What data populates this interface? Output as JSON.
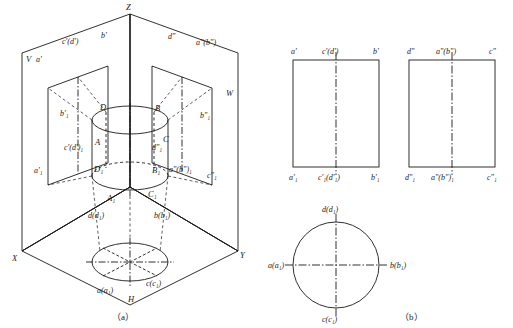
{
  "figure": {
    "caption_a": "（a）",
    "caption_b": "（b）"
  },
  "axes": {
    "z": "Z",
    "x": "X",
    "y": "Y",
    "v": "V",
    "w": "W",
    "h": "H"
  },
  "part_a": {
    "top_face": {
      "c_dprime": "c'(d')",
      "bprime": "b'",
      "aprime": "a'",
      "dprime2": "d\"",
      "a_bprime2": "a\"(b\")"
    },
    "vplane": {
      "c_d1": "c'(d')₁",
      "b1": "b'₁",
      "a1": "a'₁"
    },
    "wplane": {
      "d1w": "d\"₁",
      "b1w": "b\"₁",
      "a_b1w": "a\"(b\")₁",
      "c1w": "c\"₁"
    },
    "solid": {
      "D": "D",
      "B": "B",
      "A": "A",
      "C": "C",
      "D1": "D₁",
      "B1": "B₁",
      "A1": "A₁",
      "C1": "C₁"
    },
    "hplane": {
      "d_d1": "d(d₁)",
      "b_b1": "b(b₁)",
      "a_a1": "a(a₁)",
      "c_c1": "c(c₁)"
    }
  },
  "part_b": {
    "front_view": {
      "top_left": "a'",
      "top_mid": "c'(d')",
      "top_right": "b'",
      "bottom_left": "a'₁",
      "bottom_mid": "c'₁(d'₁)",
      "bottom_right": "b'₁"
    },
    "side_view": {
      "top_left": "d\"",
      "top_mid": "a\"(b\")",
      "top_right": "c\"",
      "bottom_left": "d\"₁",
      "bottom_mid": "a\"(b\")₁",
      "bottom_right": "c\"₁"
    },
    "top_view": {
      "top": "d(d₁)",
      "left": "a(a₁)",
      "right": "b(b₁)",
      "bottom": "c(c₁)"
    }
  }
}
